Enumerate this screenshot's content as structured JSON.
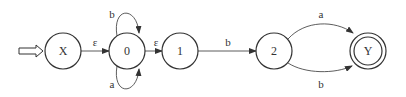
{
  "diagram": {
    "type": "finite-automaton",
    "colors": {
      "stroke": "#333333",
      "background": "#ffffff",
      "start_arrow_fill": "#ffffff"
    },
    "nodes": [
      {
        "id": "X",
        "label": "X",
        "cx": 63,
        "cy": 51,
        "accepting": false,
        "start": true
      },
      {
        "id": "0",
        "label": "0",
        "cx": 127,
        "cy": 51,
        "accepting": false
      },
      {
        "id": "1",
        "label": "1",
        "cx": 180,
        "cy": 51,
        "accepting": false
      },
      {
        "id": "2",
        "label": "2",
        "cx": 274,
        "cy": 51,
        "accepting": false
      },
      {
        "id": "Y",
        "label": "Y",
        "cx": 368,
        "cy": 51,
        "accepting": true
      }
    ],
    "edges": [
      {
        "from": "X",
        "to": "0",
        "label": "ε"
      },
      {
        "from": "0",
        "to": "0",
        "label": "b",
        "position": "top-loop"
      },
      {
        "from": "0",
        "to": "0",
        "label": "a",
        "position": "bottom-loop"
      },
      {
        "from": "0",
        "to": "1",
        "label": "ε"
      },
      {
        "from": "1",
        "to": "2",
        "label": "b"
      },
      {
        "from": "2",
        "to": "Y",
        "label": "a",
        "position": "upper-arc"
      },
      {
        "from": "2",
        "to": "Y",
        "label": "b",
        "position": "lower-arc"
      }
    ]
  }
}
